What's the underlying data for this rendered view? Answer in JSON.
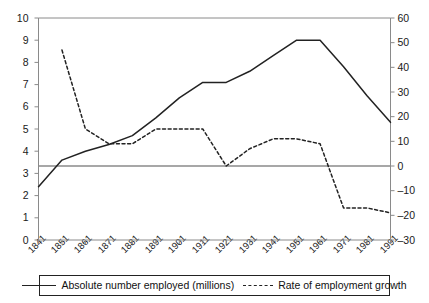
{
  "chart_data": {
    "type": "line",
    "title": "",
    "xlabel": "",
    "ylabel": "",
    "ylabel_right": "",
    "grid": false,
    "legend_position": "bottom",
    "categories": [
      "1841",
      "1851",
      "1861",
      "1871",
      "1881",
      "1891",
      "1901",
      "1911",
      "1921",
      "1931",
      "1941",
      "1951",
      "1961",
      "1971",
      "1981",
      "1991"
    ],
    "left_axis": {
      "ticks": [
        0,
        1,
        2,
        3,
        4,
        5,
        6,
        7,
        8,
        9,
        10
      ],
      "ylim": [
        0,
        10
      ],
      "unit": "millions"
    },
    "right_axis": {
      "ticks": [
        -30,
        -20,
        -10,
        0,
        10,
        20,
        30,
        40,
        50,
        60
      ],
      "ylim": [
        -30,
        60
      ],
      "unit": "percent"
    },
    "zero_reference_line": 0,
    "series": [
      {
        "name": "Absolute number employed (millions)",
        "axis": "left",
        "style": "solid",
        "color": "#222222",
        "x": [
          "1841",
          "1851",
          "1861",
          "1871",
          "1881",
          "1891",
          "1901",
          "1911",
          "1921",
          "1931",
          "1941",
          "1951",
          "1961",
          "1971",
          "1981",
          "1991"
        ],
        "values": [
          2.4,
          3.6,
          4.0,
          4.3,
          4.7,
          5.5,
          6.4,
          7.1,
          7.1,
          7.6,
          8.3,
          9.0,
          9.0,
          7.8,
          6.5,
          5.3
        ]
      },
      {
        "name": "Rate of employment growth",
        "axis": "right",
        "style": "dashed",
        "color": "#222222",
        "x": [
          "1851",
          "1861",
          "1871",
          "1881",
          "1891",
          "1901",
          "1911",
          "1921",
          "1931",
          "1941",
          "1951",
          "1961",
          "1971",
          "1981",
          "1991"
        ],
        "values": [
          47,
          15,
          9,
          9,
          15,
          15,
          15,
          0,
          7,
          11,
          11,
          9,
          -17,
          -17,
          -19
        ]
      }
    ]
  },
  "legend": {
    "items": [
      {
        "label": "Absolute number employed (millions)",
        "style": "solid"
      },
      {
        "label": "Rate of employment growth",
        "style": "dashed"
      }
    ]
  }
}
